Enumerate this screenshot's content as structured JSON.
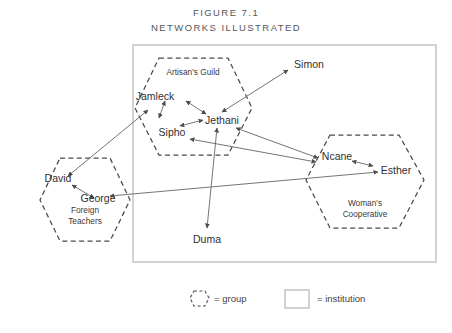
{
  "figure": {
    "label": "Figure 7.1",
    "title": "Networks Illustrated"
  },
  "groups": [
    {
      "id": "artisans-guild",
      "label": "Artisan's Guild"
    },
    {
      "id": "foreign-teachers",
      "label": "Foreign\nTeachers",
      "line1": "Foreign",
      "line2": "Teachers"
    },
    {
      "id": "womans-cooperative",
      "label": "Woman's\nCooperative",
      "line1": "Woman's",
      "line2": "Cooperative"
    }
  ],
  "nodes": [
    {
      "id": "jamleck",
      "label": "Jamleck",
      "group": "artisans-guild"
    },
    {
      "id": "sipho",
      "label": "Sipho",
      "group": "artisans-guild"
    },
    {
      "id": "jethani",
      "label": "Jethani",
      "group": "artisans-guild"
    },
    {
      "id": "simon",
      "label": "Simon",
      "group": null
    },
    {
      "id": "duma",
      "label": "Duma",
      "group": null
    },
    {
      "id": "david",
      "label": "David",
      "group": "foreign-teachers"
    },
    {
      "id": "george",
      "label": "George",
      "group": "foreign-teachers"
    },
    {
      "id": "ncane",
      "label": "Ncane",
      "group": "womans-cooperative"
    },
    {
      "id": "esther",
      "label": "Esther",
      "group": "womans-cooperative"
    }
  ],
  "edges": [
    {
      "from": "jamleck",
      "to": "jethani",
      "arrows": "both"
    },
    {
      "from": "jamleck",
      "to": "sipho",
      "arrows": "both"
    },
    {
      "from": "sipho",
      "to": "jethani",
      "arrows": "both"
    },
    {
      "from": "jethani",
      "to": "simon",
      "arrows": "both"
    },
    {
      "from": "jethani",
      "to": "duma",
      "arrows": "both"
    },
    {
      "from": "jethani",
      "to": "ncane",
      "arrows": "both"
    },
    {
      "from": "sipho",
      "to": "ncane",
      "arrows": "both"
    },
    {
      "from": "ncane",
      "to": "esther",
      "arrows": "both"
    },
    {
      "from": "david",
      "to": "george",
      "arrows": "both"
    },
    {
      "from": "david",
      "to": "jamleck",
      "arrows": "both"
    },
    {
      "from": "george",
      "to": "esther",
      "arrows": "both"
    }
  ],
  "legend": [
    {
      "id": "legend-group",
      "symbol": "dashed-hexagon",
      "text": "= group"
    },
    {
      "id": "legend-institution",
      "symbol": "solid-rectangle",
      "text": "= institution"
    }
  ],
  "colors": {
    "institution_border": "#c9c9c9",
    "group_border": "#4a4a4a",
    "edge": "#6d6d6d",
    "text": "#2f2f2f",
    "title_text": "#55565a",
    "background": "#ffffff"
  }
}
